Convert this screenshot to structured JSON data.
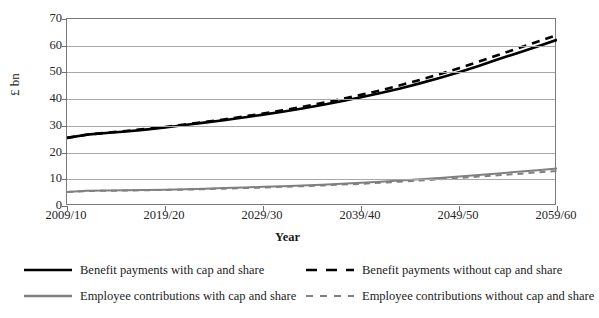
{
  "chart_data": {
    "type": "line",
    "title": "",
    "xlabel": "Year",
    "ylabel": "£ bn",
    "ylim": [
      0,
      70
    ],
    "yticks": [
      0,
      10,
      20,
      30,
      40,
      50,
      60,
      70
    ],
    "grid": true,
    "legend_position": "bottom",
    "x": [
      "2009/10",
      "2019/20",
      "2029/30",
      "2039/40",
      "2049/50",
      "2059/60"
    ],
    "xticklabels": [
      "2009/10",
      "2019/20",
      "2029/30",
      "2039/40",
      "2049/50",
      "2059/60"
    ],
    "x_values": [
      2009,
      2019,
      2029,
      2039,
      2049,
      2059
    ],
    "series": [
      {
        "name": "Benefit payments with cap and share",
        "style": "solid",
        "color": "#000000",
        "x": [
          2009,
          2011,
          2013,
          2015,
          2017,
          2019,
          2021,
          2023,
          2025,
          2027,
          2029,
          2031,
          2033,
          2035,
          2037,
          2039,
          2041,
          2043,
          2045,
          2047,
          2049,
          2051,
          2053,
          2055,
          2057,
          2059
        ],
        "values": [
          25.5,
          26.7,
          27.3,
          27.9,
          28.6,
          29.4,
          30.3,
          31.2,
          32.1,
          33.1,
          34.2,
          35.3,
          36.5,
          37.8,
          39.2,
          40.7,
          42.3,
          44.0,
          45.9,
          47.9,
          50.1,
          52.4,
          54.9,
          57.3,
          59.7,
          62.2
        ]
      },
      {
        "name": "Benefit payments without cap and share",
        "style": "dashed",
        "color": "#000000",
        "x": [
          2009,
          2011,
          2013,
          2015,
          2017,
          2019,
          2021,
          2023,
          2025,
          2027,
          2029,
          2031,
          2033,
          2035,
          2037,
          2039,
          2041,
          2043,
          2045,
          2047,
          2049,
          2051,
          2053,
          2055,
          2057,
          2059
        ],
        "values": [
          25.5,
          26.7,
          27.4,
          28.1,
          28.8,
          29.6,
          30.5,
          31.4,
          32.4,
          33.5,
          34.6,
          35.8,
          37.1,
          38.5,
          40.0,
          41.6,
          43.3,
          45.2,
          47.2,
          49.3,
          51.6,
          54.0,
          56.5,
          59.0,
          61.5,
          64.0
        ]
      },
      {
        "name": "Employee contributions with cap and share",
        "style": "solid",
        "color": "#808080",
        "x": [
          2009,
          2011,
          2013,
          2015,
          2017,
          2019,
          2021,
          2023,
          2025,
          2027,
          2029,
          2031,
          2033,
          2035,
          2037,
          2039,
          2041,
          2043,
          2045,
          2047,
          2049,
          2051,
          2053,
          2055,
          2057,
          2059
        ],
        "values": [
          5.2,
          5.7,
          5.8,
          5.9,
          6.0,
          6.1,
          6.3,
          6.5,
          6.7,
          6.9,
          7.2,
          7.4,
          7.7,
          8.0,
          8.3,
          8.7,
          9.1,
          9.5,
          10.0,
          10.5,
          11.0,
          11.6,
          12.2,
          12.8,
          13.4,
          14.0
        ]
      },
      {
        "name": "Employee contributions without cap and share",
        "style": "dashed",
        "color": "#808080",
        "x": [
          2009,
          2011,
          2013,
          2015,
          2017,
          2019,
          2021,
          2023,
          2025,
          2027,
          2029,
          2031,
          2033,
          2035,
          2037,
          2039,
          2041,
          2043,
          2045,
          2047,
          2049,
          2051,
          2053,
          2055,
          2057,
          2059
        ],
        "values": [
          5.2,
          5.6,
          5.7,
          5.8,
          5.9,
          6.0,
          6.1,
          6.3,
          6.5,
          6.7,
          6.9,
          7.2,
          7.4,
          7.7,
          8.0,
          8.3,
          8.7,
          9.1,
          9.5,
          10.0,
          10.5,
          11.0,
          11.5,
          12.0,
          12.6,
          13.1
        ]
      }
    ]
  },
  "legend": {
    "items": [
      {
        "label": "Benefit payments with cap and share"
      },
      {
        "label": "Benefit payments without cap and share"
      },
      {
        "label": "Employee contributions with cap and share"
      },
      {
        "label": "Employee contributions without cap and share"
      }
    ]
  },
  "colors": {
    "benefit": "#000000",
    "employee": "#808080",
    "grid": "#a8a8a8",
    "frame": "#7a7a7a",
    "background": "#ffffff"
  }
}
